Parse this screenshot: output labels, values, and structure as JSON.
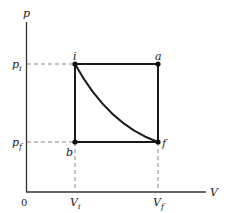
{
  "diagram": {
    "type": "pV-diagram",
    "axes": {
      "y_label": "p",
      "x_label": "V",
      "origin_label": "0"
    },
    "ticks": {
      "p_i": {
        "main": "p",
        "sub": "i"
      },
      "p_f": {
        "main": "p",
        "sub": "f"
      },
      "V_i": {
        "main": "V",
        "sub": "i"
      },
      "V_f": {
        "main": "V",
        "sub": "f"
      }
    },
    "points": [
      {
        "id": "i",
        "label": "i",
        "position": "top-left"
      },
      {
        "id": "a",
        "label": "a",
        "position": "top-right"
      },
      {
        "id": "f",
        "label": "f",
        "position": "bottom-right"
      },
      {
        "id": "b",
        "label": "b",
        "position": "bottom-left"
      }
    ],
    "paths": [
      {
        "name": "i-a",
        "kind": "isobaric"
      },
      {
        "name": "a-f",
        "kind": "isochoric"
      },
      {
        "name": "i-b",
        "kind": "isochoric"
      },
      {
        "name": "b-f",
        "kind": "isobaric"
      },
      {
        "name": "i-f",
        "kind": "curve"
      }
    ],
    "colors": {
      "line": "#1a1a1a",
      "dashed": "#888888"
    }
  }
}
